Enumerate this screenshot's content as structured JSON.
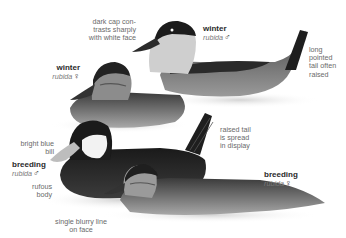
{
  "plate": {
    "colors": {
      "background": "#ffffff",
      "label_text": "#6a6a6a",
      "tag_title": "#2a2a2a",
      "ink_dark": "#1e1e1e",
      "ink_mid": "#6b6b6b",
      "ink_light": "#b8b8b8"
    }
  },
  "tags": [
    {
      "id": "winter-male",
      "title": "winter",
      "sci": "rubida",
      "sex": "♂"
    },
    {
      "id": "winter-female",
      "title": "winter",
      "sci": "rubida",
      "sex": "♀"
    },
    {
      "id": "breeding-male",
      "title": "breeding",
      "sci": "rubida",
      "sex": "♂"
    },
    {
      "id": "breeding-female",
      "title": "breeding",
      "sci": "rubida",
      "sex": "♀"
    }
  ],
  "annotations": {
    "dark_cap": [
      "dark cap con-",
      "trasts sharply",
      "with white face"
    ],
    "long_tail": [
      "long",
      "pointed",
      "tail often",
      "raised"
    ],
    "blue_bill": [
      "bright blue",
      "bill"
    ],
    "rufous_body": [
      "rufous",
      "body"
    ],
    "blurry_line": [
      "single blurry line",
      "on face"
    ],
    "raised_tail": [
      "raised tail",
      "is spread",
      "in display"
    ]
  }
}
